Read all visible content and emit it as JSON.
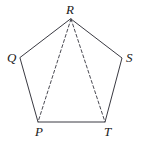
{
  "figure": {
    "name": "pentagon-with-diagonals",
    "background_color": "#ffffff",
    "stroke_color": "#3a3a42",
    "dashed_stroke_color": "#4a4a52",
    "stroke_width": 1,
    "dash_pattern": "3,2.4",
    "label_color": "#1a1a1a",
    "vertices": [
      {
        "id": "R",
        "label": "R",
        "x": 71,
        "y": 19,
        "label_x": 66,
        "label_y": 3
      },
      {
        "id": "Q",
        "label": "Q",
        "x": 20,
        "y": 58,
        "label_x": 7,
        "label_y": 51
      },
      {
        "id": "S",
        "label": "S",
        "x": 122,
        "y": 58,
        "label_x": 126,
        "label_y": 51
      },
      {
        "id": "P",
        "label": "P",
        "x": 38,
        "y": 122,
        "label_x": 35,
        "label_y": 125
      },
      {
        "id": "T",
        "label": "T",
        "x": 105,
        "y": 122,
        "label_x": 104,
        "label_y": 125
      }
    ],
    "solid_edges": [
      {
        "from": "Q",
        "to": "R"
      },
      {
        "from": "R",
        "to": "S"
      },
      {
        "from": "S",
        "to": "T"
      },
      {
        "from": "T",
        "to": "P"
      },
      {
        "from": "P",
        "to": "Q"
      }
    ],
    "dashed_edges": [
      {
        "from": "R",
        "to": "P"
      },
      {
        "from": "R",
        "to": "T"
      }
    ],
    "outline_path": "M 71,19 L 122,58 L 105,122 L 38,122 L 20,58 Z",
    "diagonal_RP_path": "M 71,19 L 38,122",
    "diagonal_RT_path": "M 71,19 L 105,122"
  },
  "labels": {
    "R": "R",
    "Q": "Q",
    "S": "S",
    "P": "P",
    "T": "T"
  }
}
